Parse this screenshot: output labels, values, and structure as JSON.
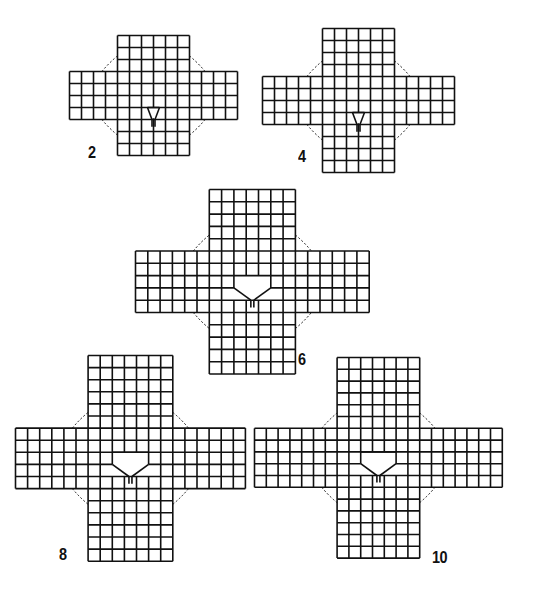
{
  "diagram": {
    "type": "knitting-chart-schematic",
    "line_color": "#111111",
    "figures": [
      {
        "label": "2",
        "origin": [
          68,
          34
        ],
        "cell": 12,
        "center_cols": 6,
        "left_cols": 4,
        "right_cols": 4,
        "top_rows": 3,
        "band_rows": 4,
        "bottom_rows": 3,
        "notch": {
          "width_cells": 1,
          "open_rows": 0
        },
        "label_pos": [
          88,
          143
        ]
      },
      {
        "label": "4",
        "origin": [
          261,
          27
        ],
        "cell": 12,
        "center_cols": 6,
        "left_cols": 5,
        "right_cols": 5,
        "top_rows": 4,
        "band_rows": 4,
        "bottom_rows": 4,
        "notch": {
          "width_cells": 1,
          "open_rows": 0
        },
        "label_pos": [
          298,
          147
        ]
      },
      {
        "label": "6",
        "origin": [
          134,
          188
        ],
        "cell": 12.3,
        "center_cols": 7,
        "left_cols": 6,
        "right_cols": 6,
        "top_rows": 5,
        "band_rows": 5,
        "bottom_rows": 5,
        "notch": {
          "width_cells": 3,
          "open_rows": 1
        },
        "label_pos": [
          298,
          350
        ]
      },
      {
        "label": "8",
        "origin": [
          14,
          354
        ],
        "cell": 12.1,
        "center_cols": 7,
        "left_cols": 6,
        "right_cols": 6,
        "top_rows": 6,
        "band_rows": 5,
        "bottom_rows": 6,
        "notch": {
          "width_cells": 3,
          "open_rows": 1
        },
        "label_pos": [
          59,
          545
        ]
      },
      {
        "label": "10",
        "origin": [
          253,
          356
        ],
        "cell": 11.8,
        "center_cols": 7,
        "left_cols": 7,
        "right_cols": 7,
        "top_rows": 6,
        "band_rows": 5,
        "bottom_rows": 6,
        "notch": {
          "width_cells": 3,
          "open_rows": 1
        },
        "label_pos": [
          432,
          548
        ]
      }
    ]
  }
}
